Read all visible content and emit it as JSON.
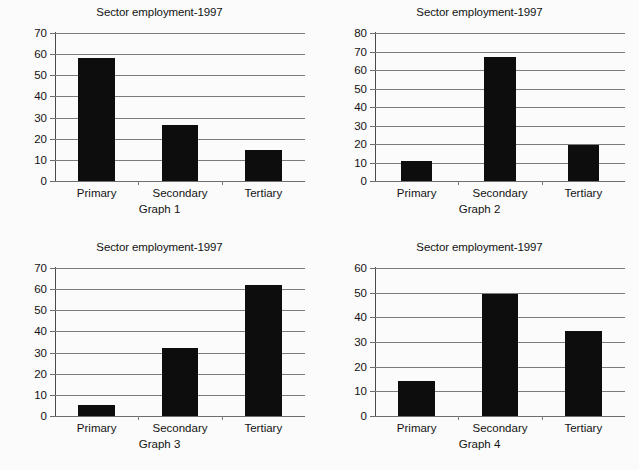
{
  "page": {
    "background_color": "#fbfbfb",
    "bar_color": "#0d0d0d",
    "axis_color": "#7b7b7b",
    "text_color": "#131313"
  },
  "chart_data": [
    {
      "type": "bar",
      "title": "Sector employment-1997",
      "caption": "Graph 1",
      "xlabel": "",
      "ylabel": "",
      "categories": [
        "Primary",
        "Secondary",
        "Tertiary"
      ],
      "values": [
        58,
        26.5,
        14.5
      ],
      "ylim": [
        0,
        70
      ],
      "ytick_step": 10,
      "yticks": [
        0,
        10,
        20,
        30,
        40,
        50,
        60,
        70
      ],
      "grid": true,
      "legend": "none"
    },
    {
      "type": "bar",
      "title": "Sector employment-1997",
      "caption": "Graph 2",
      "xlabel": "",
      "ylabel": "",
      "categories": [
        "Primary",
        "Secondary",
        "Tertiary"
      ],
      "values": [
        11,
        67,
        19.5
      ],
      "ylim": [
        0,
        80
      ],
      "ytick_step": 10,
      "yticks": [
        0,
        10,
        20,
        30,
        40,
        50,
        60,
        70,
        80
      ],
      "grid": true,
      "legend": "none"
    },
    {
      "type": "bar",
      "title": "Sector employment-1997",
      "caption": "Graph 3",
      "xlabel": "",
      "ylabel": "",
      "categories": [
        "Primary",
        "Secondary",
        "Tertiary"
      ],
      "values": [
        5,
        32,
        62
      ],
      "ylim": [
        0,
        70
      ],
      "ytick_step": 10,
      "yticks": [
        0,
        10,
        20,
        30,
        40,
        50,
        60,
        70
      ],
      "grid": true,
      "legend": "none"
    },
    {
      "type": "bar",
      "title": "Sector employment-1997",
      "caption": "Graph 4",
      "xlabel": "",
      "ylabel": "",
      "categories": [
        "Primary",
        "Secondary",
        "Tertiary"
      ],
      "values": [
        14,
        49.5,
        34.5
      ],
      "ylim": [
        0,
        60
      ],
      "ytick_step": 10,
      "yticks": [
        0,
        10,
        20,
        30,
        40,
        50,
        60
      ],
      "grid": true,
      "legend": "none"
    }
  ]
}
